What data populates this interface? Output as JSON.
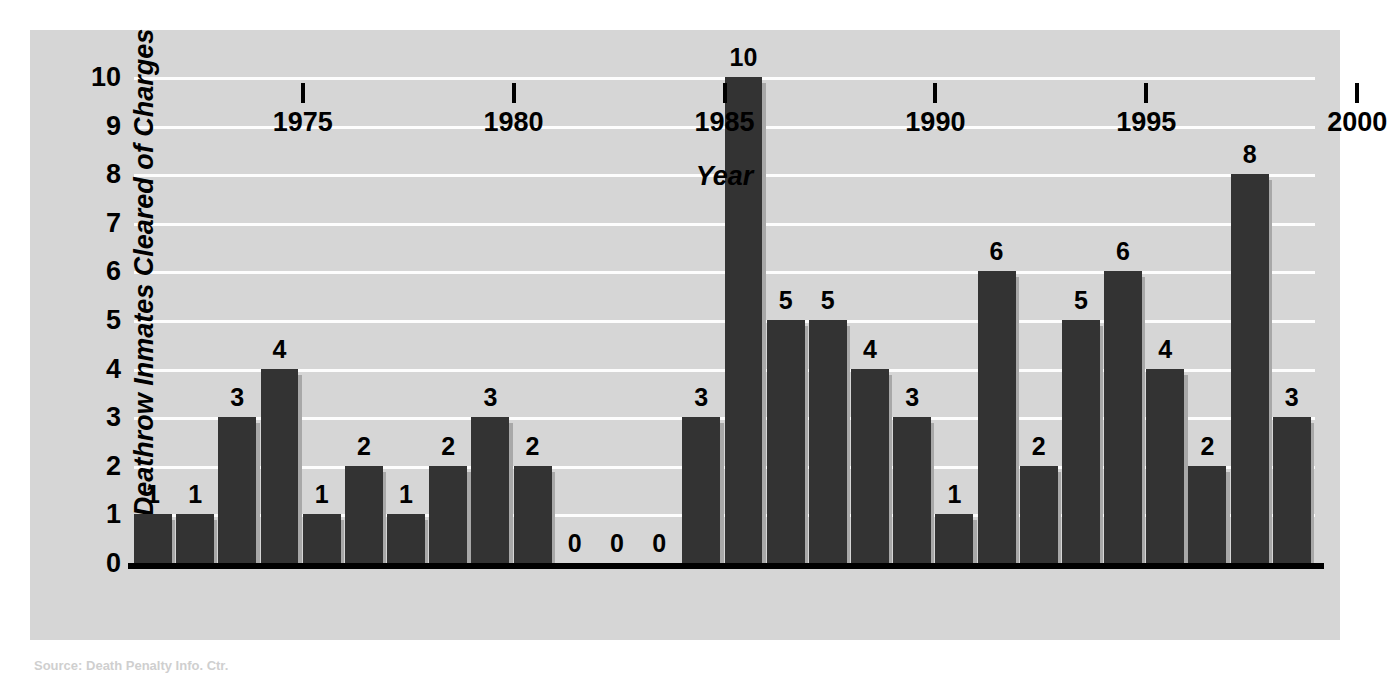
{
  "chart_data": {
    "type": "bar",
    "title": "",
    "xlabel": "Year",
    "ylabel": "Deathrow Inmates Cleared of Charges",
    "categories": [
      1972,
      1973,
      1974,
      1975,
      1976,
      1977,
      1978,
      1979,
      1980,
      1981,
      1982,
      1983,
      1984,
      1985,
      1986,
      1987,
      1988,
      1989,
      1990,
      1991,
      1992,
      1993,
      1994,
      1995,
      1996,
      1997,
      1998,
      1999
    ],
    "values": [
      1,
      1,
      3,
      4,
      1,
      2,
      1,
      2,
      3,
      2,
      0,
      0,
      0,
      3,
      10,
      5,
      5,
      4,
      3,
      1,
      6,
      2,
      5,
      6,
      4,
      2,
      8,
      3
    ],
    "data_labels": [
      "1",
      "1",
      "3",
      "4",
      "1",
      "2",
      "1",
      "2",
      "3",
      "2",
      "0",
      "0",
      "0",
      "3",
      "10",
      "5",
      "5",
      "4",
      "3",
      "1",
      "6",
      "2",
      "5",
      "6",
      "4",
      "2",
      "8",
      "3"
    ],
    "ylim": [
      0,
      10
    ],
    "yticks": [
      "0",
      "1",
      "2",
      "3",
      "4",
      "5",
      "6",
      "7",
      "8",
      "9",
      "10"
    ],
    "xticks": [
      "1975",
      "1980",
      "1985",
      "1990",
      "1995",
      "2000"
    ],
    "xtick_positions": [
      1975,
      1980,
      1985,
      1990,
      1995,
      2000
    ],
    "grid": "horizontal-white",
    "legend": "none",
    "bar_color": "#333333",
    "bar_shadow_color": "#a8a8a8",
    "panel_color": "#d6d6d6",
    "gridline_color": "#fdfdfd",
    "axis_color": "#000000"
  },
  "caption": {
    "source": "Source: Death Penalty Info. Ctr."
  }
}
